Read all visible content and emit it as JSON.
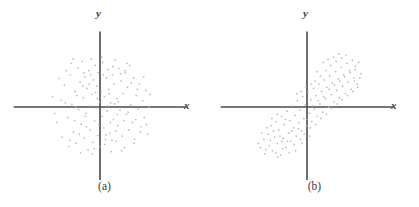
{
  "figure": {
    "background_color": "#ffffff",
    "axis_color": "#4a4a4a",
    "point_color": "#b9b9b9",
    "label_color": "#3f3f3f",
    "panels": [
      {
        "caption": "(a)",
        "x_axis_label": "x",
        "y_axis_label": "y"
      },
      {
        "caption": "(b)",
        "x_axis_label": "x",
        "y_axis_label": "y"
      }
    ]
  },
  "chart_data": [
    {
      "type": "scatter",
      "title": "(a)",
      "xlabel": "x",
      "ylabel": "y",
      "grid": false,
      "legend": false,
      "axes": "centered-cross",
      "xlim": [
        -1.6,
        1.6
      ],
      "ylim": [
        -1.45,
        1.45
      ],
      "description": "Isotropic circular point cloud centered at the origin; no correlation between x and y.",
      "correlation": 0.0,
      "n_points": 132,
      "points": [
        [
          -0.72,
          0.13
        ],
        [
          -0.66,
          0.42
        ],
        [
          -0.6,
          -0.2
        ],
        [
          -0.55,
          0.62
        ],
        [
          -0.52,
          0.05
        ],
        [
          -0.49,
          -0.48
        ],
        [
          -0.46,
          0.3
        ],
        [
          -0.44,
          -0.7
        ],
        [
          -0.41,
          0.75
        ],
        [
          -0.39,
          -0.05
        ],
        [
          -0.37,
          0.48
        ],
        [
          -0.35,
          -0.33
        ],
        [
          -0.33,
          0.88
        ],
        [
          -0.31,
          0.18
        ],
        [
          -0.29,
          -0.6
        ],
        [
          -0.28,
          0.58
        ],
        [
          -0.26,
          -0.12
        ],
        [
          -0.24,
          0.36
        ],
        [
          -0.22,
          -0.82
        ],
        [
          -0.21,
          0.7
        ],
        [
          -0.19,
          0.02
        ],
        [
          -0.18,
          -0.44
        ],
        [
          -0.16,
          0.92
        ],
        [
          -0.15,
          0.25
        ],
        [
          -0.13,
          -0.68
        ],
        [
          -0.12,
          0.52
        ],
        [
          -0.1,
          -0.27
        ],
        [
          -0.09,
          0.8
        ],
        [
          -0.07,
          -0.02
        ],
        [
          -0.06,
          0.4
        ],
        [
          -0.04,
          -0.55
        ],
        [
          -0.03,
          0.66
        ],
        [
          -0.01,
          0.1
        ],
        [
          0.01,
          -0.76
        ],
        [
          0.02,
          0.3
        ],
        [
          0.04,
          -0.18
        ],
        [
          0.05,
          0.86
        ],
        [
          0.07,
          -0.4
        ],
        [
          0.08,
          0.2
        ],
        [
          0.1,
          -0.62
        ],
        [
          0.12,
          0.56
        ],
        [
          0.13,
          -0.08
        ],
        [
          0.15,
          0.72
        ],
        [
          0.16,
          0.34
        ],
        [
          0.18,
          -0.5
        ],
        [
          0.2,
          0.08
        ],
        [
          0.21,
          -0.86
        ],
        [
          0.23,
          0.62
        ],
        [
          0.25,
          -0.24
        ],
        [
          0.26,
          0.44
        ],
        [
          0.28,
          0.9
        ],
        [
          0.3,
          -0.66
        ],
        [
          0.31,
          0.16
        ],
        [
          0.33,
          -0.36
        ],
        [
          0.35,
          0.74
        ],
        [
          0.37,
          -0.06
        ],
        [
          0.39,
          0.5
        ],
        [
          0.41,
          -0.56
        ],
        [
          0.43,
          0.26
        ],
        [
          0.45,
          -0.78
        ],
        [
          0.47,
          0.66
        ],
        [
          0.49,
          -0.14
        ],
        [
          0.51,
          0.38
        ],
        [
          0.53,
          -0.44
        ],
        [
          0.55,
          0.8
        ],
        [
          0.57,
          0.04
        ],
        [
          0.6,
          -0.3
        ],
        [
          0.62,
          0.56
        ],
        [
          0.64,
          -0.62
        ],
        [
          0.67,
          0.22
        ],
        [
          0.7,
          -0.04
        ],
        [
          0.73,
          0.44
        ],
        [
          0.76,
          -0.38
        ],
        [
          0.79,
          0.12
        ],
        [
          0.82,
          -0.2
        ],
        [
          0.85,
          0.32
        ],
        [
          0.88,
          -0.52
        ],
        [
          0.91,
          0.0
        ],
        [
          -0.8,
          -0.3
        ],
        [
          -0.76,
          0.55
        ],
        [
          -0.7,
          -0.58
        ],
        [
          -0.64,
          0.08
        ],
        [
          -0.58,
          -0.76
        ],
        [
          -0.53,
          0.84
        ],
        [
          -0.47,
          -0.26
        ],
        [
          -0.43,
          0.22
        ],
        [
          -0.36,
          -0.88
        ],
        [
          -0.3,
          0.66
        ],
        [
          -0.25,
          -0.38
        ],
        [
          -0.2,
          0.44
        ],
        [
          -0.14,
          -0.9
        ],
        [
          -0.08,
          0.28
        ],
        [
          -0.02,
          -0.34
        ],
        [
          0.03,
          0.96
        ],
        [
          0.09,
          -0.72
        ],
        [
          0.14,
          0.02
        ],
        [
          0.19,
          -0.3
        ],
        [
          0.24,
          0.78
        ],
        [
          0.29,
          -0.46
        ],
        [
          0.34,
          0.1
        ],
        [
          0.4,
          -0.84
        ],
        [
          0.46,
          0.7
        ],
        [
          0.52,
          -0.1
        ],
        [
          0.58,
          0.46
        ],
        [
          0.63,
          -0.7
        ],
        [
          0.69,
          0.34
        ],
        [
          0.75,
          -0.48
        ],
        [
          0.81,
          0.58
        ],
        [
          0.86,
          -0.34
        ],
        [
          0.93,
          0.24
        ],
        [
          -0.88,
          0.2
        ],
        [
          -0.84,
          -0.12
        ],
        [
          -0.62,
          0.7
        ],
        [
          -0.56,
          -0.64
        ],
        [
          -0.5,
          0.92
        ],
        [
          -0.45,
          0.0
        ],
        [
          -0.38,
          -0.52
        ],
        [
          -0.32,
          0.4
        ],
        [
          -0.27,
          -0.18
        ],
        [
          -0.17,
          0.62
        ],
        [
          -0.11,
          -0.8
        ],
        [
          -0.05,
          0.16
        ],
        [
          0.06,
          0.62
        ],
        [
          0.11,
          -0.54
        ],
        [
          0.17,
          0.26
        ],
        [
          0.22,
          -0.64
        ],
        [
          0.27,
          0.06
        ],
        [
          0.32,
          -0.14
        ],
        [
          0.38,
          0.64
        ],
        [
          0.44,
          -0.26
        ],
        [
          0.5,
          0.84
        ],
        [
          0.66,
          -0.24
        ]
      ]
    },
    {
      "type": "scatter",
      "title": "(b)",
      "xlabel": "x",
      "ylabel": "y",
      "grid": false,
      "legend": false,
      "axes": "centered-cross",
      "xlim": [
        -1.6,
        1.6
      ],
      "ylim": [
        -1.45,
        1.45
      ],
      "description": "Elliptical point cloud tilted about 45 degrees running from lower-left to upper-right; strong positive correlation between x and y.",
      "correlation": 0.85,
      "n_points": 132,
      "points": [
        [
          -0.86,
          -0.78
        ],
        [
          -0.8,
          -0.62
        ],
        [
          -0.78,
          -0.9
        ],
        [
          -0.72,
          -0.52
        ],
        [
          -0.7,
          -0.74
        ],
        [
          -0.66,
          -0.36
        ],
        [
          -0.64,
          -0.84
        ],
        [
          -0.6,
          -0.58
        ],
        [
          -0.57,
          -0.28
        ],
        [
          -0.55,
          -0.7
        ],
        [
          -0.52,
          -0.44
        ],
        [
          -0.49,
          -0.92
        ],
        [
          -0.47,
          -0.18
        ],
        [
          -0.44,
          -0.6
        ],
        [
          -0.42,
          -0.34
        ],
        [
          -0.39,
          -0.78
        ],
        [
          -0.37,
          -0.08
        ],
        [
          -0.34,
          -0.5
        ],
        [
          -0.32,
          -0.26
        ],
        [
          -0.3,
          -0.66
        ],
        [
          -0.27,
          0.02
        ],
        [
          -0.25,
          -0.4
        ],
        [
          -0.22,
          -0.16
        ],
        [
          -0.2,
          -0.56
        ],
        [
          -0.18,
          0.12
        ],
        [
          -0.15,
          -0.3
        ],
        [
          -0.13,
          -0.06
        ],
        [
          -0.1,
          -0.46
        ],
        [
          -0.08,
          0.2
        ],
        [
          -0.06,
          -0.22
        ],
        [
          -0.03,
          0.04
        ],
        [
          -0.01,
          -0.36
        ],
        [
          0.02,
          0.28
        ],
        [
          0.04,
          -0.12
        ],
        [
          0.07,
          0.14
        ],
        [
          0.09,
          -0.28
        ],
        [
          0.12,
          0.36
        ],
        [
          0.14,
          -0.04
        ],
        [
          0.17,
          0.22
        ],
        [
          0.19,
          -0.18
        ],
        [
          0.22,
          0.44
        ],
        [
          0.24,
          0.06
        ],
        [
          0.27,
          0.3
        ],
        [
          0.29,
          -0.1
        ],
        [
          0.32,
          0.52
        ],
        [
          0.34,
          0.16
        ],
        [
          0.37,
          0.38
        ],
        [
          0.4,
          0.0
        ],
        [
          0.42,
          0.6
        ],
        [
          0.45,
          0.24
        ],
        [
          0.47,
          0.46
        ],
        [
          0.5,
          0.1
        ],
        [
          0.53,
          0.68
        ],
        [
          0.55,
          0.32
        ],
        [
          0.58,
          0.54
        ],
        [
          0.6,
          0.18
        ],
        [
          0.63,
          0.76
        ],
        [
          0.66,
          0.4
        ],
        [
          0.68,
          0.62
        ],
        [
          0.71,
          0.26
        ],
        [
          0.74,
          0.84
        ],
        [
          0.76,
          0.48
        ],
        [
          0.79,
          0.7
        ],
        [
          0.82,
          0.34
        ],
        [
          0.84,
          0.9
        ],
        [
          0.87,
          0.56
        ],
        [
          0.9,
          0.78
        ],
        [
          0.93,
          0.44
        ],
        [
          0.96,
          0.86
        ],
        [
          1.0,
          0.64
        ],
        [
          -0.9,
          -0.7
        ],
        [
          -0.84,
          -0.5
        ],
        [
          -0.76,
          -0.82
        ],
        [
          -0.68,
          -0.64
        ],
        [
          -0.62,
          -0.46
        ],
        [
          -0.58,
          -0.88
        ],
        [
          -0.5,
          -0.56
        ],
        [
          -0.45,
          -0.8
        ],
        [
          -0.4,
          -0.24
        ],
        [
          -0.36,
          -0.66
        ],
        [
          -0.28,
          -0.46
        ],
        [
          -0.24,
          -0.72
        ],
        [
          -0.16,
          -0.42
        ],
        [
          -0.12,
          -0.62
        ],
        [
          -0.05,
          -0.52
        ],
        [
          0.0,
          -0.24
        ],
        [
          0.06,
          -0.4
        ],
        [
          0.11,
          0.02
        ],
        [
          0.16,
          -0.34
        ],
        [
          0.21,
          0.12
        ],
        [
          0.26,
          -0.22
        ],
        [
          0.31,
          0.2
        ],
        [
          0.36,
          -0.14
        ],
        [
          0.41,
          0.34
        ],
        [
          0.46,
          -0.02
        ],
        [
          0.51,
          0.42
        ],
        [
          0.56,
          0.06
        ],
        [
          0.61,
          0.5
        ],
        [
          0.65,
          0.14
        ],
        [
          0.7,
          0.58
        ],
        [
          0.75,
          0.22
        ],
        [
          0.8,
          0.66
        ],
        [
          0.85,
          0.3
        ],
        [
          0.89,
          0.72
        ],
        [
          0.94,
          0.38
        ],
        [
          -0.74,
          -0.4
        ],
        [
          -0.54,
          -0.96
        ],
        [
          -0.46,
          -0.66
        ],
        [
          -0.33,
          -0.88
        ],
        [
          -0.21,
          -0.84
        ],
        [
          -0.09,
          -0.7
        ],
        [
          0.05,
          -0.56
        ],
        [
          0.15,
          0.5
        ],
        [
          0.25,
          0.6
        ],
        [
          0.35,
          0.7
        ],
        [
          0.44,
          0.8
        ],
        [
          0.54,
          0.88
        ],
        [
          0.64,
          0.94
        ],
        [
          0.72,
          1.0
        ],
        [
          0.18,
          0.68
        ],
        [
          0.08,
          0.44
        ],
        [
          -0.02,
          0.38
        ],
        [
          -0.11,
          0.3
        ],
        [
          -0.19,
          0.26
        ],
        [
          0.3,
          0.86
        ],
        [
          0.39,
          0.92
        ],
        [
          0.49,
          0.96
        ],
        [
          0.59,
          1.02
        ],
        [
          -0.65,
          -0.22
        ],
        [
          -0.55,
          -0.14
        ],
        [
          0.88,
          0.5
        ],
        [
          0.98,
          0.56
        ]
      ]
    }
  ]
}
